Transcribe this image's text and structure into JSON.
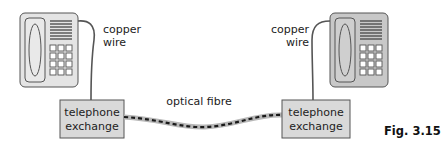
{
  "diagram": {
    "type": "telephone network diagram",
    "left": {
      "phone_label": "telephone",
      "wire_label_line1": "copper",
      "wire_label_line2": "wire",
      "exchange_line1": "telephone",
      "exchange_line2": "exchange"
    },
    "right": {
      "phone_label": "telephone",
      "wire_label_line1": "copper",
      "wire_label_line2": "wire",
      "exchange_line1": "telephone",
      "exchange_line2": "exchange"
    },
    "link_label": "optical fibre",
    "figure_label": "Fig. 3.15"
  },
  "colors": {
    "phone_left_body": "#e4e4e4",
    "phone_right_body": "#c8c8c8",
    "exchange_fill": "#d9d9d9",
    "fibre_outer": "#b8b8b8",
    "fibre_dash": "#1a1a1a",
    "wire": "#555555",
    "outline": "#555555"
  }
}
